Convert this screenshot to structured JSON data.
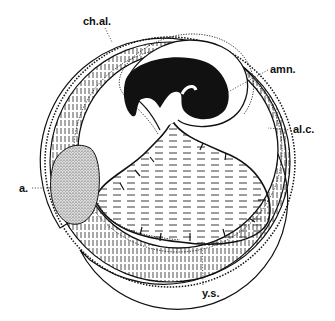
{
  "figure": {
    "labels": [
      {
        "id": "ch_al",
        "text": "ch.al.",
        "x": 83,
        "y": 25
      },
      {
        "id": "amn",
        "text": "amn.",
        "x": 270,
        "y": 73
      },
      {
        "id": "al_c",
        "text": "al.c.",
        "x": 293,
        "y": 133
      },
      {
        "id": "a",
        "text": "a.",
        "x": 19,
        "y": 192
      },
      {
        "id": "y_s",
        "text": "y.s.",
        "x": 202,
        "y": 297
      }
    ],
    "colors": {
      "ink": "#111111",
      "paper": "#ffffff",
      "stipple": "#bbbbbb"
    }
  }
}
